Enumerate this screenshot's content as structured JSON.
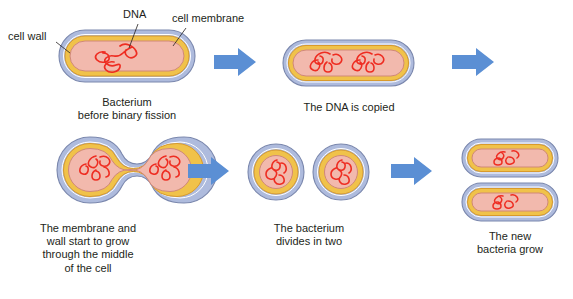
{
  "diagram": {
    "colors": {
      "cell_wall": "#aebbdd",
      "cell_wall_stroke": "#7a87ad",
      "cell_membrane": "#f0c24a",
      "cell_membrane_stroke": "#d99a2b",
      "cytoplasm": "#f2b9ad",
      "cytoplasm_stroke": "#d08878",
      "dna": "#ee2d22",
      "arrow": "#5b8fd4",
      "text": "#231f20",
      "leader_line": "#231f20",
      "background": "#ffffff"
    },
    "annotations": [
      {
        "id": "cell-wall",
        "label": "cell wall",
        "x": 8,
        "y": 30
      },
      {
        "id": "dna",
        "label": "DNA",
        "x": 123,
        "y": 8
      },
      {
        "id": "cell-membrane",
        "label": "cell membrane",
        "x": 172,
        "y": 12
      }
    ],
    "stages": [
      {
        "id": "stage-1",
        "order": 1,
        "shape": "rod",
        "dna_copies": 1,
        "caption": "Bacterium\nbefore binary fission",
        "caption_lines": [
          "Bacterium",
          "before binary fission"
        ],
        "caption_x": 62,
        "caption_y": 96
      },
      {
        "id": "stage-2",
        "order": 2,
        "shape": "rod",
        "dna_copies": 2,
        "caption": "The DNA is copied",
        "caption_lines": [
          "The DNA is copied"
        ],
        "caption_x": 281,
        "caption_y": 101
      },
      {
        "id": "stage-3",
        "order": 3,
        "shape": "dumbbell",
        "dna_copies": 2,
        "caption": "The membrane and\nwall start to grow\nthrough the middle\nof the cell",
        "caption_lines": [
          "The membrane and",
          "wall start to grow",
          "through the middle",
          "of the cell"
        ],
        "caption_x": 8,
        "caption_y": 222
      },
      {
        "id": "stage-4",
        "order": 4,
        "shape": "two-round-cells",
        "dna_copies": 2,
        "caption": "The bacterium\ndivides in two",
        "caption_lines": [
          "The bacterium",
          "divides in two"
        ],
        "caption_x": 247,
        "caption_y": 222
      },
      {
        "id": "stage-5",
        "order": 5,
        "shape": "two-rod-cells",
        "dna_copies": 2,
        "caption": "The new\nbacteria grow",
        "caption_lines": [
          "The new",
          "bacteria grow"
        ],
        "caption_x": 455,
        "caption_y": 230
      }
    ],
    "arrows": [
      {
        "id": "arrow-1",
        "from": "stage-1",
        "to": "stage-2",
        "direction": "right"
      },
      {
        "id": "arrow-2",
        "from": "stage-2",
        "to": "stage-3",
        "direction": "right"
      },
      {
        "id": "arrow-3",
        "from": "stage-3",
        "to": "stage-4",
        "direction": "right"
      },
      {
        "id": "arrow-4",
        "from": "stage-4",
        "to": "stage-5",
        "direction": "right"
      }
    ]
  }
}
